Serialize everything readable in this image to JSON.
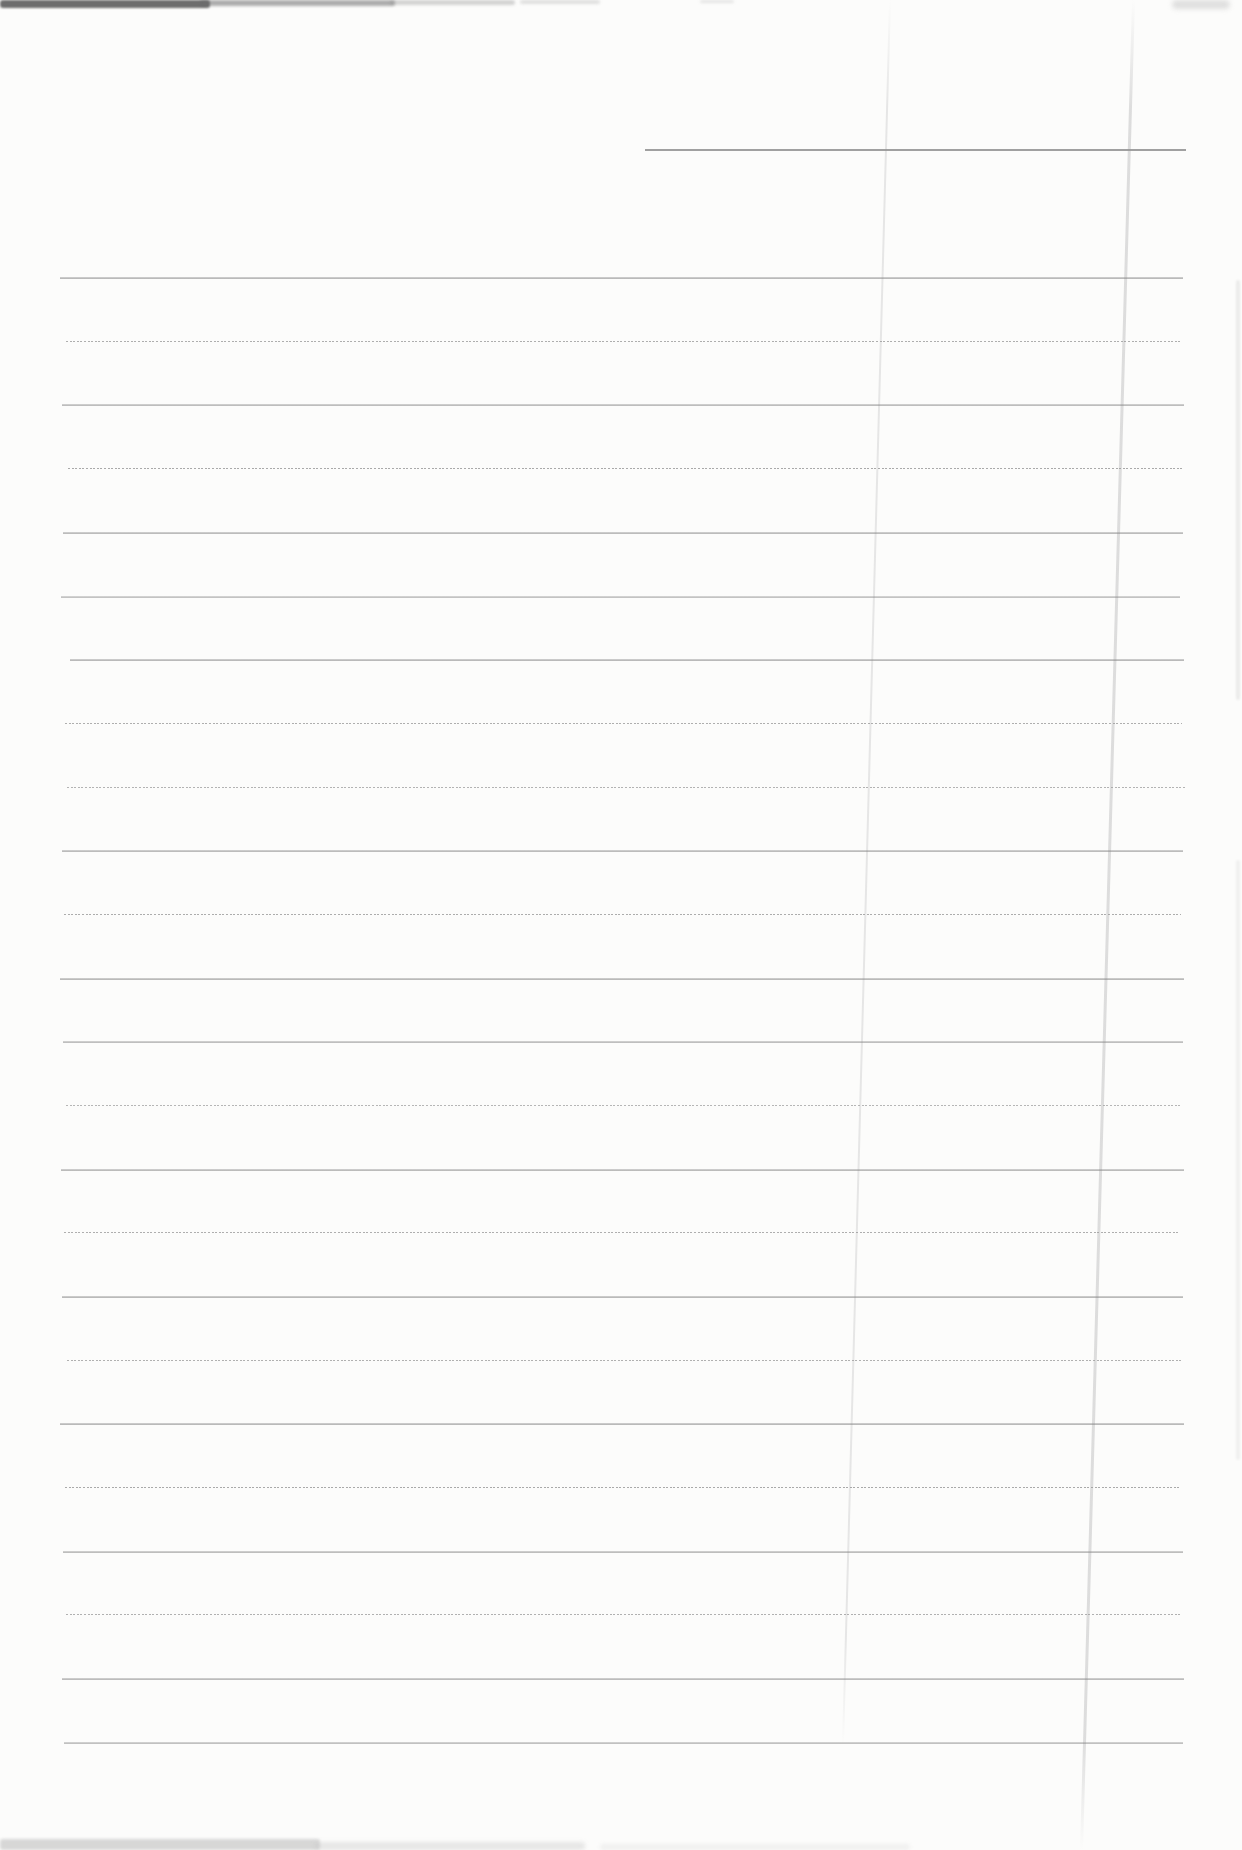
{
  "page": {
    "kind": "scanned blank lined notebook page",
    "written_content": "",
    "width_px": 1242,
    "height_px": 1850,
    "background_color": "#fcfcfb"
  },
  "header_line": {
    "y": 149,
    "x_start": 645,
    "x_end": 1186,
    "color": "#969696",
    "opacity": 0.9
  },
  "ruled_lines": {
    "count": 24,
    "spacing_px": 63.7,
    "color_solid": "#898989",
    "color_dotted": "#9b9b9b",
    "lines": [
      {
        "y": 277,
        "left": 60,
        "right": 1183,
        "style": "solid",
        "opacity": 0.95
      },
      {
        "y": 341,
        "left": 66,
        "right": 1181,
        "style": "dotted",
        "opacity": 0.8
      },
      {
        "y": 404,
        "left": 62,
        "right": 1184,
        "style": "solid",
        "opacity": 0.9
      },
      {
        "y": 468,
        "left": 68,
        "right": 1182,
        "style": "dotted",
        "opacity": 0.85
      },
      {
        "y": 532,
        "left": 63,
        "right": 1183,
        "style": "solid",
        "opacity": 0.92
      },
      {
        "y": 596,
        "left": 61,
        "right": 1180,
        "style": "solid",
        "opacity": 0.82
      },
      {
        "y": 659,
        "left": 70,
        "right": 1184,
        "style": "solid",
        "opacity": 0.95
      },
      {
        "y": 723,
        "left": 65,
        "right": 1182,
        "style": "dotted",
        "opacity": 0.8
      },
      {
        "y": 787,
        "left": 67,
        "right": 1185,
        "style": "dotted",
        "opacity": 0.75
      },
      {
        "y": 850,
        "left": 62,
        "right": 1183,
        "style": "solid",
        "opacity": 0.92
      },
      {
        "y": 914,
        "left": 64,
        "right": 1181,
        "style": "dotted",
        "opacity": 0.82
      },
      {
        "y": 978,
        "left": 60,
        "right": 1184,
        "style": "solid",
        "opacity": 0.95
      },
      {
        "y": 1041,
        "left": 63,
        "right": 1183,
        "style": "solid",
        "opacity": 0.88
      },
      {
        "y": 1105,
        "left": 66,
        "right": 1182,
        "style": "dotted",
        "opacity": 0.72
      },
      {
        "y": 1169,
        "left": 61,
        "right": 1184,
        "style": "solid",
        "opacity": 0.93
      },
      {
        "y": 1232,
        "left": 64,
        "right": 1180,
        "style": "dotted",
        "opacity": 0.8
      },
      {
        "y": 1296,
        "left": 62,
        "right": 1183,
        "style": "solid",
        "opacity": 0.95
      },
      {
        "y": 1360,
        "left": 67,
        "right": 1182,
        "style": "dotted",
        "opacity": 0.78
      },
      {
        "y": 1423,
        "left": 60,
        "right": 1184,
        "style": "solid",
        "opacity": 0.95
      },
      {
        "y": 1487,
        "left": 65,
        "right": 1181,
        "style": "dotted",
        "opacity": 0.85
      },
      {
        "y": 1551,
        "left": 63,
        "right": 1183,
        "style": "solid",
        "opacity": 0.9
      },
      {
        "y": 1614,
        "left": 66,
        "right": 1182,
        "style": "dotted",
        "opacity": 0.78
      },
      {
        "y": 1678,
        "left": 62,
        "right": 1184,
        "style": "solid",
        "opacity": 0.92
      },
      {
        "y": 1742,
        "left": 64,
        "right": 1183,
        "style": "solid",
        "opacity": 0.85
      }
    ]
  },
  "creases": [
    {
      "name": "vertical-crease-left",
      "x_top": 889,
      "x_bottom": 842,
      "y_top": 0,
      "y_bottom": 1745,
      "width": 2,
      "color": "#e2e2e2",
      "opacity": 0.85
    },
    {
      "name": "vertical-crease-right",
      "x_top": 1132,
      "x_bottom": 1080,
      "y_top": 0,
      "y_bottom": 1850,
      "width": 3,
      "color": "#dbdbdb",
      "opacity": 0.95
    }
  ],
  "artifacts": [
    {
      "name": "scan-artifact-top-edge-dark",
      "x": 0,
      "y": 0,
      "w": 210,
      "h": 8,
      "color": "#4a4a4a",
      "opacity": 0.8,
      "blur": 1.2,
      "radius": 3
    },
    {
      "name": "scan-artifact-top-edge-mid",
      "x": 200,
      "y": 0,
      "w": 195,
      "h": 6,
      "color": "#6b6b6b",
      "opacity": 0.55,
      "blur": 1.5,
      "radius": 3
    },
    {
      "name": "scan-artifact-top-edge-fade",
      "x": 390,
      "y": 0,
      "w": 125,
      "h": 5,
      "color": "#8d8d8d",
      "opacity": 0.38,
      "blur": 1.8,
      "radius": 3
    },
    {
      "name": "scan-artifact-top-edge-specks",
      "x": 520,
      "y": 0,
      "w": 80,
      "h": 4,
      "color": "#9c9c9c",
      "opacity": 0.3,
      "blur": 1.8,
      "radius": 2
    },
    {
      "name": "scan-artifact-top-speck",
      "x": 700,
      "y": 0,
      "w": 34,
      "h": 3,
      "color": "#a8a8a8",
      "opacity": 0.28,
      "blur": 1.5,
      "radius": 2
    },
    {
      "name": "scan-artifact-top-right-smudge",
      "x": 1172,
      "y": 0,
      "w": 58,
      "h": 9,
      "color": "#c2c2c2",
      "opacity": 0.5,
      "blur": 2.5,
      "radius": 5
    },
    {
      "name": "scan-artifact-right-edge-upper",
      "x": 1236,
      "y": 280,
      "w": 4,
      "h": 420,
      "color": "#cccccc",
      "opacity": 0.35,
      "blur": 1.2,
      "radius": 2
    },
    {
      "name": "scan-artifact-right-edge-lower",
      "x": 1236,
      "y": 860,
      "w": 4,
      "h": 600,
      "color": "#d2d2d2",
      "opacity": 0.28,
      "blur": 1.2,
      "radius": 2
    },
    {
      "name": "scan-artifact-bottom-edge-left",
      "x": 0,
      "y": 1839,
      "w": 320,
      "h": 11,
      "color": "#b3b3b3",
      "opacity": 0.5,
      "blur": 1.8,
      "radius": 3
    },
    {
      "name": "scan-artifact-bottom-edge-mid",
      "x": 315,
      "y": 1842,
      "w": 270,
      "h": 8,
      "color": "#c6c6c6",
      "opacity": 0.4,
      "blur": 2.0,
      "radius": 3
    },
    {
      "name": "scan-artifact-bottom-edge-fade",
      "x": 600,
      "y": 1844,
      "w": 310,
      "h": 6,
      "color": "#d3d3d3",
      "opacity": 0.3,
      "blur": 2.0,
      "radius": 3
    }
  ]
}
